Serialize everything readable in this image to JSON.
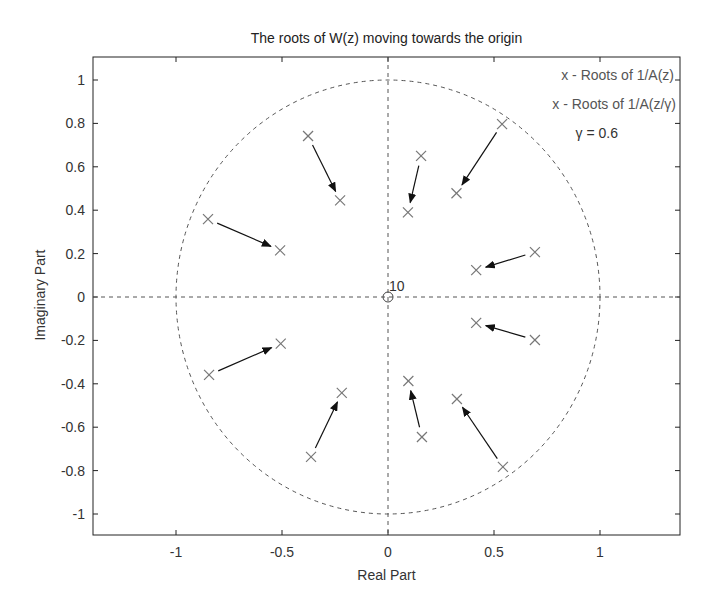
{
  "chart_data": {
    "type": "scatter",
    "title": "The roots of W(z) moving towards the origin",
    "xlabel": "Real Part",
    "ylabel": "Imaginary Part",
    "xlim": [
      -1.4,
      1.4
    ],
    "ylim": [
      -1.1,
      1.1
    ],
    "xticks": [
      -1,
      -0.5,
      0,
      0.5,
      1
    ],
    "xtick_labels": [
      "-1",
      "-0.5",
      "0",
      "0.5",
      "1"
    ],
    "yticks": [
      1,
      0.8,
      0.6,
      0.4,
      0.2,
      0,
      -0.2,
      -0.4,
      -0.6,
      -0.8,
      -1
    ],
    "ytick_labels": [
      "1",
      "0.8",
      "0.6",
      "0.4",
      "0.2",
      "0",
      "-0.2",
      "-0.4",
      "-0.6",
      "-0.8",
      "-1"
    ],
    "grid": false,
    "unit_circle": true,
    "gamma": 0.6,
    "series": [
      {
        "name": "x - Roots of 1/A(z)",
        "marker": "x",
        "points": [
          [
            -0.377,
            0.742
          ],
          [
            -0.849,
            0.359
          ],
          [
            -0.844,
            -0.359
          ],
          [
            -0.363,
            -0.737
          ],
          [
            0.156,
            0.65
          ],
          [
            0.16,
            -0.645
          ],
          [
            0.538,
            0.797
          ],
          [
            0.542,
            -0.783
          ],
          [
            0.693,
            0.207
          ],
          [
            0.693,
            -0.198
          ]
        ]
      },
      {
        "name": "x - Roots of 1/A(z/γ)",
        "marker": "x",
        "points": [
          [
            -0.226,
            0.445
          ],
          [
            -0.509,
            0.215
          ],
          [
            -0.506,
            -0.215
          ],
          [
            -0.218,
            -0.442
          ],
          [
            0.094,
            0.39
          ],
          [
            0.096,
            -0.387
          ],
          [
            0.323,
            0.478
          ],
          [
            0.325,
            -0.47
          ],
          [
            0.416,
            0.124
          ],
          [
            0.416,
            -0.119
          ]
        ]
      }
    ],
    "origin_marker": {
      "label": "10",
      "x": 0,
      "y": 0,
      "marker": "o"
    },
    "annotations": [
      "γ = 0.6"
    ],
    "legend_position": "upper right"
  },
  "legend": {
    "line1": "x - Roots of 1/A(z)",
    "line2": "x - Roots of 1/A(z/γ)",
    "line3": "γ = 0.6"
  }
}
